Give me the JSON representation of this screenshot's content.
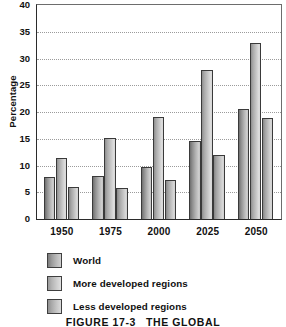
{
  "chart_data": {
    "type": "bar",
    "title": "",
    "xlabel": "",
    "ylabel": "Percentage",
    "ylim": [
      0,
      40
    ],
    "ytick_step": 5,
    "yticks": [
      0,
      5,
      10,
      15,
      20,
      25,
      30,
      35,
      40
    ],
    "grid": true,
    "grid_axis": "y",
    "legend_position": "below-plot-left",
    "categories": [
      "1950",
      "1975",
      "2000",
      "2025",
      "2050"
    ],
    "series": [
      {
        "name": "World",
        "values": [
          7.8,
          8.1,
          9.8,
          14.6,
          20.6
        ],
        "color": "#a8a8a8"
      },
      {
        "name": "More developed regions",
        "values": [
          11.4,
          15.1,
          19.0,
          27.8,
          32.9
        ],
        "color": "#c6c6c6"
      },
      {
        "name": "Less developed regions",
        "values": [
          6.0,
          5.8,
          7.2,
          12.0,
          18.8
        ],
        "color": "#bcbcbc"
      }
    ]
  },
  "axes": {
    "y_title": "Percentage",
    "y_tick_labels": [
      "40",
      "35",
      "30",
      "25",
      "20",
      "15",
      "10",
      "5",
      "0"
    ],
    "x_tick_labels": [
      "1950",
      "1975",
      "2000",
      "2025",
      "2050"
    ]
  },
  "legend": {
    "items": [
      {
        "label": "World"
      },
      {
        "label": "More developed regions"
      },
      {
        "label": "Less developed regions"
      }
    ]
  },
  "caption": {
    "number": "FIGURE 17-3",
    "text": "THE GLOBAL"
  }
}
